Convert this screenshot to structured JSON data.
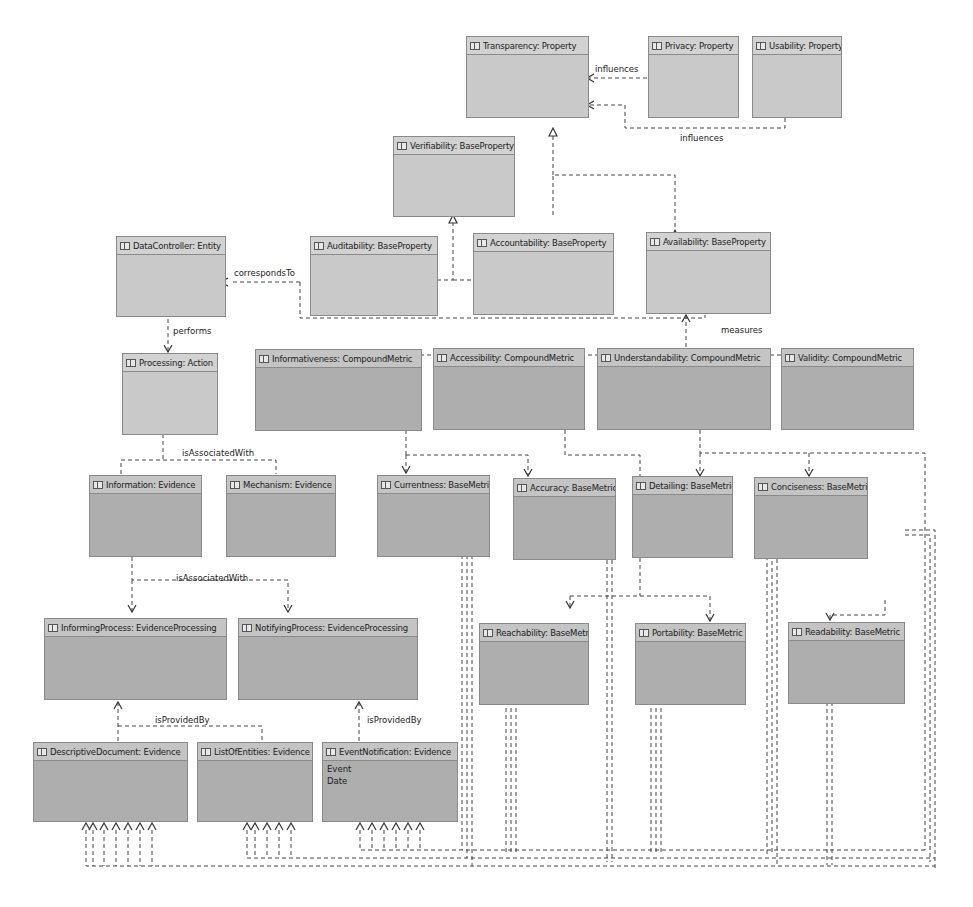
{
  "diagram": {
    "nodes": {
      "transparency": {
        "label": "Transparency: Property"
      },
      "privacy": {
        "label": "Privacy: Property"
      },
      "usability": {
        "label": "Usability: Property"
      },
      "verifiability": {
        "label": "Verifiability: BaseProperty"
      },
      "datacontroller": {
        "label": "DataController: Entity"
      },
      "auditability": {
        "label": "Auditability: BaseProperty"
      },
      "accountability": {
        "label": "Accountability: BaseProperty"
      },
      "availability": {
        "label": "Availability: BaseProperty"
      },
      "processing": {
        "label": "Processing: Action"
      },
      "informativeness": {
        "label": "Informativeness: CompoundMetric"
      },
      "accessibility": {
        "label": "Accessibility: CompoundMetric"
      },
      "understandability": {
        "label": "Understandability: CompoundMetric"
      },
      "validity": {
        "label": "Validity: CompoundMetric"
      },
      "information": {
        "label": "Information: Evidence"
      },
      "mechanism": {
        "label": "Mechanism: Evidence"
      },
      "currentness": {
        "label": "Currentness: BaseMetric"
      },
      "accuracy": {
        "label": "Accuracy: BaseMetric"
      },
      "detailing": {
        "label": "Detailing: BaseMetric"
      },
      "conciseness": {
        "label": "Conciseness: BaseMetric"
      },
      "informingprocess": {
        "label": "InformingProcess: EvidenceProcessing"
      },
      "notifyingprocess": {
        "label": "NotifyingProcess: EvidenceProcessing"
      },
      "reachability": {
        "label": "Reachability: BaseMetric"
      },
      "portability": {
        "label": "Portability: BaseMetric"
      },
      "readability": {
        "label": "Readability: BaseMetric"
      },
      "descriptivedocument": {
        "label": "DescriptiveDocument: Evidence"
      },
      "listofentities": {
        "label": "ListOfEntities: Evidence"
      },
      "eventnotification": {
        "label": "EventNotification: Evidence",
        "attributes": [
          "Event",
          "Date"
        ]
      }
    },
    "edge_labels": {
      "influences_privacy": "influences",
      "influences_usability": "influences",
      "corresponds_to": "correspondsTo",
      "performs": "performs",
      "measures": "measures",
      "is_associated_with_processing": "isAssociatedWith",
      "is_associated_with_process": "isAssociatedWith",
      "is_provided_by_informing": "isProvidedBy",
      "is_provided_by_notifying": "isProvidedBy"
    }
  }
}
